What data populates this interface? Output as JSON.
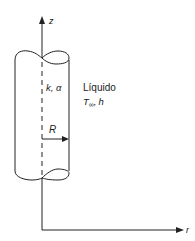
{
  "diagram": {
    "type": "cylinder-coordinate-sketch",
    "axes": {
      "vertical_label": "z",
      "horizontal_label": "r"
    },
    "solid": {
      "properties_label": "k, α"
    },
    "fluid": {
      "name": "Líquido",
      "temperature_symbol": "T",
      "temperature_subscript": "∞",
      "separator": ",",
      "coefficient_symbol": "h"
    },
    "radius_label": "R",
    "colors": {
      "stroke": "#222222",
      "background": "#ffffff"
    }
  }
}
